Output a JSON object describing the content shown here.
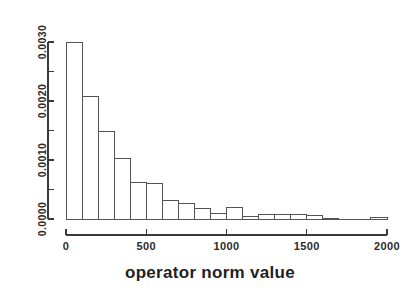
{
  "chart_data": {
    "type": "bar",
    "title": "",
    "subtitle": "",
    "xlabel": "operator norm value",
    "ylabel": "",
    "xlim": [
      0,
      2050
    ],
    "ylim": [
      0.0,
      0.0031
    ],
    "grid": false,
    "legend": null,
    "bin_width": 100,
    "x_tick_labels": [
      "0",
      "500",
      "1000",
      "1500",
      "2000"
    ],
    "x_tick_values": [
      0,
      500,
      1000,
      1500,
      2000
    ],
    "x_minor_tick_values": [
      250,
      750,
      1250,
      1750
    ],
    "y_tick_labels": [
      "0.0000",
      "0.0010",
      "0.0020",
      "0.0030"
    ],
    "y_tick_values": [
      0.0,
      0.001,
      0.002,
      0.003
    ],
    "y_minor_tick_values": [
      0.0005,
      0.0015,
      0.0025
    ],
    "bin_edges": [
      0,
      100,
      200,
      300,
      400,
      500,
      600,
      700,
      800,
      900,
      1000,
      1100,
      1200,
      1300,
      1400,
      1500,
      1600,
      1700,
      1800,
      1900,
      2000
    ],
    "categories": [
      "0-100",
      "100-200",
      "200-300",
      "300-400",
      "400-500",
      "500-600",
      "600-700",
      "700-800",
      "800-900",
      "900-1000",
      "1000-1100",
      "1100-1200",
      "1200-1300",
      "1300-1400",
      "1400-1500",
      "1500-1600",
      "1600-1700",
      "1700-1800",
      "1800-1900",
      "1900-2000"
    ],
    "values": [
      0.003,
      0.00208,
      0.00149,
      0.00102,
      0.00062,
      0.00061,
      0.00032,
      0.00027,
      0.00017,
      0.0001,
      0.00019,
      5e-05,
      8e-05,
      8e-05,
      7e-05,
      6e-05,
      1e-05,
      0.0,
      0.0,
      2e-05
    ]
  },
  "axes": {
    "x_axis_name": "x-axis",
    "y_axis_name": "y-axis (density)"
  },
  "colors": {
    "background": "#ffffff",
    "bar_fill": "#ffffff",
    "bar_stroke": "#545454",
    "axis": "#3a3a3a",
    "text": "#2b2b2b"
  }
}
